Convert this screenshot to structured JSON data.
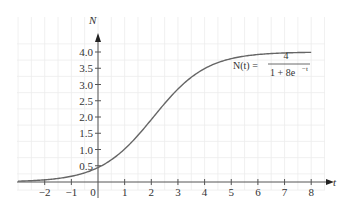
{
  "chart_data": {
    "type": "line",
    "title": "",
    "xlabel": "t",
    "ylabel": "N",
    "xlim": [
      -3,
      8.5
    ],
    "ylim": [
      -0.25,
      4.6
    ],
    "x_ticks": [
      "-2",
      "-1",
      "0",
      "1",
      "2",
      "3",
      "4",
      "5",
      "6",
      "7",
      "8"
    ],
    "y_ticks": [
      "0.5",
      "1.0",
      "1.5",
      "2.0",
      "2.5",
      "3.0",
      "3.5",
      "4.0"
    ],
    "grid": true,
    "legend": null,
    "annotation": {
      "lhs": "N(t) =",
      "numerator": "4",
      "denominator": "1 + 8e",
      "exponent": "−t"
    },
    "series": [
      {
        "name": "N(t) = 4/(1+8e^-t)",
        "x": [
          -3,
          -2,
          -1,
          0,
          1,
          2,
          3,
          4,
          5,
          6,
          7,
          8
        ],
        "values": [
          0.1,
          0.25,
          0.51,
          0.44,
          1.01,
          1.92,
          2.86,
          3.49,
          3.8,
          3.92,
          3.97,
          3.99
        ]
      }
    ]
  }
}
